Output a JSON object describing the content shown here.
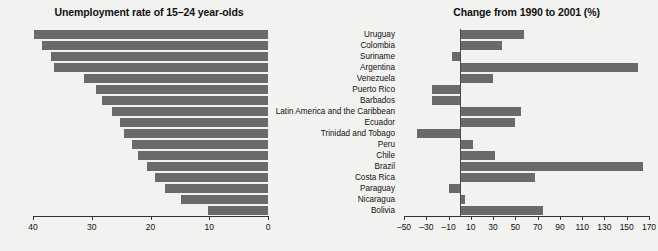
{
  "left": {
    "title": "Unemployment rate of 15–24 year-olds",
    "axis_ticks": [
      "40",
      "30",
      "20",
      "10",
      "0"
    ]
  },
  "right": {
    "title": "Change from 1990 to 2001 (%)",
    "axis_ticks": [
      "–50",
      "–30",
      "–10",
      "10",
      "30",
      "50",
      "70",
      "90",
      "110",
      "130",
      "150",
      "170"
    ]
  },
  "categories": [
    "Uruguay",
    "Colombia",
    "Suriname",
    "Argentina",
    "Venezuela",
    "Puerto Rico",
    "Barbados",
    "Latin America and the Caribbean",
    "Ecuador",
    "Trinidad and Tobago",
    "Peru",
    "Chile",
    "Brazil",
    "Costa Rica",
    "Paraguay",
    "Nicaragua",
    "Bolivia"
  ],
  "colors": {
    "bar": "#6a6a6a",
    "axis": "#333333",
    "background": "#f2f2f0",
    "text": "#111111"
  },
  "chart_data": [
    {
      "type": "bar",
      "orientation": "horizontal",
      "title": "Unemployment rate of 15–24 year-olds",
      "xlabel": "",
      "ylabel": "",
      "xlim": [
        40,
        0
      ],
      "x_inverted": true,
      "grid": false,
      "legend": "none",
      "categories": [
        "Uruguay",
        "Colombia",
        "Suriname",
        "Argentina",
        "Venezuela",
        "Puerto Rico",
        "Barbados",
        "Latin America and the Caribbean",
        "Ecuador",
        "Trinidad and Tobago",
        "Peru",
        "Chile",
        "Brazil",
        "Costa Rica",
        "Paraguay",
        "Nicaragua",
        "Bolivia"
      ],
      "values": [
        39.8,
        38.5,
        37.0,
        36.5,
        31.3,
        29.2,
        28.2,
        26.5,
        25.2,
        24.5,
        23.2,
        22.2,
        20.6,
        19.3,
        17.6,
        14.8,
        10.2
      ],
      "xticks": [
        40,
        30,
        20,
        10,
        0
      ]
    },
    {
      "type": "bar",
      "orientation": "horizontal",
      "title": "Change from 1990 to 2001 (%)",
      "xlabel": "",
      "ylabel": "",
      "xlim": [
        -50,
        170
      ],
      "grid": false,
      "legend": "none",
      "categories": [
        "Uruguay",
        "Colombia",
        "Suriname",
        "Argentina",
        "Venezuela",
        "Puerto Rico",
        "Barbados",
        "Latin America and the Caribbean",
        "Ecuador",
        "Trinidad and Tobago",
        "Peru",
        "Chile",
        "Brazil",
        "Costa Rica",
        "Paraguay",
        "Nicaragua",
        "Bolivia"
      ],
      "values": [
        58,
        38,
        -7,
        160,
        30,
        -25,
        -25,
        55,
        50,
        -38,
        12,
        32,
        165,
        68,
        -10,
        5,
        75
      ],
      "xticks": [
        -50,
        -30,
        -10,
        10,
        30,
        50,
        70,
        90,
        110,
        130,
        150,
        170
      ]
    }
  ]
}
